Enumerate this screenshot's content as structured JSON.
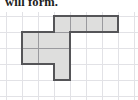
{
  "caption": {
    "text": "will form."
  },
  "figure": {
    "name": "polyomino-net-on-grid",
    "colors": {
      "page_background": "#ffffff",
      "grid_line": "#e2e2e6",
      "cell_fill": "#dededd",
      "outline": "#555558",
      "inner_line": "#9a9a9e",
      "text": "#1c1c1c"
    },
    "grid": {
      "cell_size_px": 16,
      "origin_x_px": 6,
      "origin_y_px": 4,
      "columns": 8,
      "rows": 6
    },
    "net": {
      "cell_count": 11,
      "cells": [
        {
          "col": 3,
          "row": 0
        },
        {
          "col": 4,
          "row": 0
        },
        {
          "col": 5,
          "row": 0
        },
        {
          "col": 6,
          "row": 0
        },
        {
          "col": 1,
          "row": 1
        },
        {
          "col": 2,
          "row": 1
        },
        {
          "col": 3,
          "row": 1
        },
        {
          "col": 1,
          "row": 2
        },
        {
          "col": 2,
          "row": 2
        },
        {
          "col": 3,
          "row": 2
        },
        {
          "col": 3,
          "row": 3
        }
      ],
      "outline_segments": [
        {
          "type": "h",
          "col": 3,
          "row": 0,
          "span": 4,
          "side": "top"
        },
        {
          "type": "h",
          "col": 1,
          "row": 1,
          "span": 2,
          "side": "top"
        },
        {
          "type": "h",
          "col": 1,
          "row": 3,
          "span": 2,
          "side": "top"
        },
        {
          "type": "h",
          "col": 3,
          "row": 4,
          "span": 1,
          "side": "top"
        },
        {
          "type": "h",
          "col": 4,
          "row": 1,
          "span": 3,
          "side": "top"
        },
        {
          "type": "v",
          "col": 1,
          "row": 1,
          "span": 2,
          "side": "left"
        },
        {
          "type": "v",
          "col": 3,
          "row": 0,
          "span": 4,
          "side": "left"
        },
        {
          "type": "v",
          "col": 7,
          "row": 0,
          "span": 1,
          "side": "left"
        },
        {
          "type": "v",
          "col": 4,
          "row": 0,
          "span": 1,
          "side": "left"
        },
        {
          "type": "v",
          "col": 4,
          "row": 1,
          "span": 3,
          "side": "left"
        }
      ],
      "inner_segments": [
        {
          "type": "v",
          "col": 2,
          "row": 1,
          "span": 2
        },
        {
          "type": "v",
          "col": 4,
          "row": 0,
          "span": 1
        },
        {
          "type": "v",
          "col": 5,
          "row": 0,
          "span": 1
        },
        {
          "type": "v",
          "col": 6,
          "row": 0,
          "span": 1
        },
        {
          "type": "h",
          "col": 1,
          "row": 2,
          "span": 3
        },
        {
          "type": "h",
          "col": 3,
          "row": 1,
          "span": 1
        }
      ]
    }
  }
}
